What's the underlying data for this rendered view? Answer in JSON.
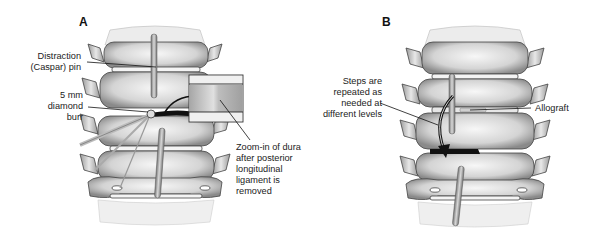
{
  "figure": {
    "panels": [
      {
        "letter": "A",
        "labels": {
          "distraction_pin": [
            "Distraction",
            "(Caspar) pin"
          ],
          "diamond_burr": [
            "5 mm",
            "diamond",
            "burr"
          ],
          "zoom_in": [
            "Zoom-in of dura",
            "after posterior",
            "longitudinal",
            "ligament is",
            "removed"
          ]
        }
      },
      {
        "letter": "B",
        "labels": {
          "steps_repeated": [
            "Steps are",
            "repeated as",
            "needed at",
            "different levels"
          ],
          "allograft": [
            "Allograft"
          ]
        }
      }
    ],
    "colors": {
      "bone_light": "#f2f2f2",
      "bone_mid": "#c8c8c8",
      "bone_shadow": "#6a6a6a",
      "outline": "#333333",
      "dark_gap": "#111111"
    }
  }
}
